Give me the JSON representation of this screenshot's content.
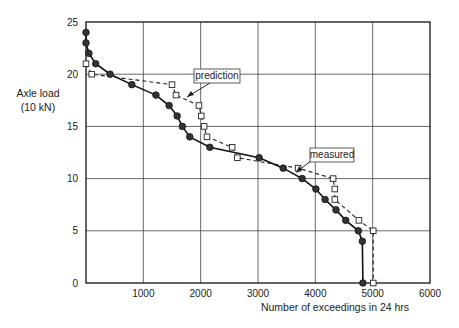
{
  "chart_data": {
    "type": "line",
    "title": "",
    "xlabel": "Number of exceedings in 24 hrs",
    "ylabel": "Axle load",
    "ylabel_unit": "(10 kN)",
    "xlim": [
      0,
      6000
    ],
    "ylim": [
      0,
      25
    ],
    "x_ticks": [
      "1000",
      "2000",
      "3000",
      "4000",
      "5000",
      "6000"
    ],
    "y_ticks": [
      "0",
      "5",
      "10",
      "15",
      "20",
      "25"
    ],
    "grid": true,
    "legend": "none (inline callout annotations)",
    "annotations": [
      {
        "text": "prediction",
        "points_to_series": "prediction"
      },
      {
        "text": "measured",
        "points_to_series": "measured"
      }
    ],
    "series": [
      {
        "name": "measured",
        "style": "solid line, filled circle markers",
        "points": [
          [
            0,
            24
          ],
          [
            0,
            23
          ],
          [
            50,
            22
          ],
          [
            170,
            21
          ],
          [
            420,
            20
          ],
          [
            800,
            19
          ],
          [
            1220,
            18
          ],
          [
            1450,
            17
          ],
          [
            1590,
            16
          ],
          [
            1680,
            15
          ],
          [
            1810,
            14
          ],
          [
            2160,
            13
          ],
          [
            3020,
            12
          ],
          [
            3440,
            11
          ],
          [
            3770,
            10
          ],
          [
            4010,
            9
          ],
          [
            4170,
            8
          ],
          [
            4360,
            7
          ],
          [
            4530,
            6
          ],
          [
            4750,
            5
          ],
          [
            4820,
            4
          ],
          [
            4830,
            0
          ]
        ]
      },
      {
        "name": "prediction",
        "style": "dashed line, open square markers",
        "points": [
          [
            0,
            21
          ],
          [
            100,
            20
          ],
          [
            1500,
            19
          ],
          [
            1570,
            18
          ],
          [
            1970,
            17
          ],
          [
            2010,
            16
          ],
          [
            2060,
            15
          ],
          [
            2110,
            14
          ],
          [
            2550,
            13
          ],
          [
            2640,
            12
          ],
          [
            3700,
            11
          ],
          [
            4310,
            10
          ],
          [
            4340,
            9
          ],
          [
            4340,
            8
          ],
          [
            4760,
            6
          ],
          [
            5010,
            5
          ],
          [
            5010,
            0
          ]
        ]
      }
    ]
  },
  "labels": {
    "ylabel_line1": "Axle load",
    "ylabel_line2": "(10 kN)",
    "xlabel": "Number of exceedings in 24 hrs",
    "prediction_callout": "prediction",
    "measured_callout": "measured"
  }
}
